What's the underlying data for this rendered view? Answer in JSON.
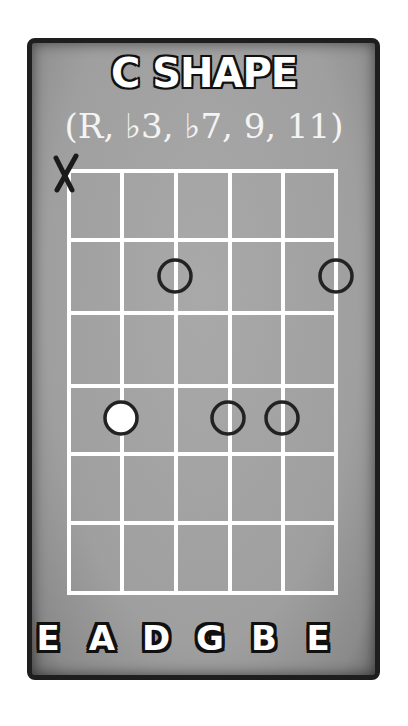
{
  "diagram": {
    "title": "C SHAPE",
    "subtitle": "(R, ♭3, ♭7, 9, 11)",
    "muted_string_marker": "X",
    "strings": [
      "E",
      "A",
      "D",
      "G",
      "B",
      "E"
    ],
    "frets_shown": 6,
    "muted": [
      {
        "string": "E (low)",
        "symbol": "X"
      }
    ],
    "notes": [
      {
        "fret": 2,
        "string_index": 2,
        "string": "D",
        "type": "open-circle"
      },
      {
        "fret": 2,
        "string_index": 5,
        "string": "E (high)",
        "type": "open-circle"
      },
      {
        "fret": 4,
        "string_index": 1,
        "string": "A",
        "type": "root-filled-white"
      },
      {
        "fret": 4,
        "string_index": 3,
        "string": "G",
        "type": "open-circle"
      },
      {
        "fret": 4,
        "string_index": 4,
        "string": "B",
        "type": "open-circle"
      }
    ],
    "colors": {
      "panel": "#a3a3a3",
      "border": "#1e1e1e",
      "grid_lines": "#ffffff",
      "note_outline": "#222222",
      "root_fill": "#ffffff"
    }
  }
}
